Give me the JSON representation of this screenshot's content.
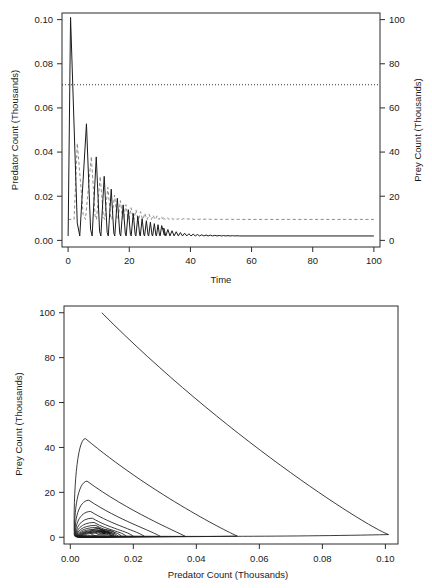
{
  "figure": {
    "panels": [
      "timeseries",
      "phase"
    ]
  },
  "chart_data": [
    {
      "id": "timeseries",
      "type": "line",
      "title": "",
      "xlabel": "Time",
      "ylabel": "Predator Count (Thousands)",
      "y2label": "Prey Count (Thousands)",
      "xlim": [
        -2,
        102
      ],
      "ylim": [
        -0.003,
        0.103
      ],
      "y2lim": [
        -3,
        103
      ],
      "grid": false,
      "legend": "none",
      "xticks": [
        0,
        20,
        40,
        60,
        80,
        100
      ],
      "xticklabels": [
        "0",
        "20",
        "40",
        "60",
        "80",
        "100"
      ],
      "yticks": [
        0.0,
        0.02,
        0.04,
        0.06,
        0.08,
        0.1
      ],
      "yticklabels": [
        "0.00",
        "0.02",
        "0.04",
        "0.06",
        "0.08",
        "0.10"
      ],
      "y2ticks": [
        0,
        20,
        40,
        60,
        80,
        100
      ],
      "y2ticklabels": [
        "0",
        "20",
        "40",
        "60",
        "80",
        "100"
      ],
      "series": [
        {
          "name": "Predator Count",
          "axis": "left",
          "style": "solid",
          "color": "#1a1a1a",
          "description": "Damped oscillation spikes decaying toward steady state 0.002",
          "peak_times": [
            0.8,
            6.0,
            9.2,
            11.8,
            14.1,
            16.1,
            18.0,
            19.7,
            21.3,
            22.8,
            24.2,
            25.6,
            26.9,
            28.2,
            29.4,
            30.6
          ],
          "peak_values": [
            0.101,
            0.0528,
            0.0378,
            0.029,
            0.0232,
            0.0191,
            0.0161,
            0.0139,
            0.0122,
            0.0109,
            0.0098,
            0.0089,
            0.0082,
            0.0076,
            0.0071,
            0.0067
          ],
          "steady_state": 0.002
        },
        {
          "name": "Prey Count",
          "axis": "right",
          "style": "dashed",
          "color": "#8e8e8e",
          "description": "Damped oscillation lagging predator, decaying toward steady state 9.5",
          "peak_times": [
            3.0,
            7.6,
            10.5,
            13.0,
            15.2,
            17.1,
            18.9,
            20.6,
            22.2,
            23.7,
            25.1,
            26.5,
            27.8,
            29.1,
            30.3
          ],
          "peak_values": [
            44.0,
            38.0,
            29.0,
            24.0,
            20.5,
            18.0,
            16.2,
            14.8,
            13.8,
            13.0,
            12.3,
            11.8,
            11.4,
            11.1,
            10.8
          ],
          "steady_state": 9.5
        },
        {
          "name": "Threshold",
          "axis": "left",
          "style": "dotted",
          "color": "#1a1a1a",
          "description": "Horizontal reference line",
          "value": 0.0705,
          "value_right_axis": 70
        }
      ]
    },
    {
      "id": "phase",
      "type": "line",
      "title": "",
      "xlabel": "Predator Count (Thousands)",
      "ylabel": "Prey Count (Thousands)",
      "xlim": [
        -0.002,
        0.104
      ],
      "ylim": [
        -3,
        103
      ],
      "grid": false,
      "legend": "none",
      "xticks": [
        0.0,
        0.02,
        0.04,
        0.06,
        0.08,
        0.1
      ],
      "xticklabels": [
        "0.00",
        "0.02",
        "0.04",
        "0.06",
        "0.08",
        "0.10"
      ],
      "yticks": [
        0,
        20,
        40,
        60,
        80,
        100
      ],
      "yticklabels": [
        "0",
        "20",
        "40",
        "60",
        "80",
        "100"
      ],
      "series": [
        {
          "name": "Phase trajectory",
          "style": "solid",
          "color": "#1a1a1a",
          "description": "Inward spiral from (0.010, 100) converging on focus near (0.012, 2)",
          "start_point": [
            0.01,
            100
          ],
          "focus_point": [
            0.012,
            2
          ],
          "loop_max_predator": [
            0.101,
            0.053,
            0.0365,
            0.0285,
            0.0235,
            0.02,
            0.0178,
            0.0163,
            0.0152,
            0.0145,
            0.0139,
            0.0135,
            0.0132,
            0.0129
          ],
          "loop_max_prey": [
            100,
            44.0,
            25.0,
            16.5,
            11.5,
            8.5,
            6.6,
            5.3,
            4.4,
            3.7,
            3.2,
            2.9,
            2.6,
            2.4
          ]
        }
      ]
    }
  ]
}
